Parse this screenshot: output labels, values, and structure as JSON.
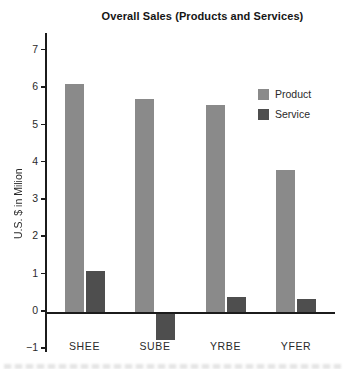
{
  "title": "Overall Sales (Products and Services)",
  "chart_data": {
    "type": "bar",
    "title": "Overall Sales (Products and Services)",
    "categories": [
      "SHEE",
      "SUBE",
      "YRBE",
      "YFER"
    ],
    "series": [
      {
        "name": "Product",
        "color": "#8a8a8a",
        "values": [
          6.1,
          5.7,
          5.55,
          3.8
        ]
      },
      {
        "name": "Service",
        "color": "#4e4e4e",
        "values": [
          1.1,
          -0.7,
          0.4,
          0.35
        ]
      }
    ],
    "xlabel": "",
    "ylabel": "U.S. $ in Milion",
    "ylim": [
      -1,
      7
    ],
    "yticks": [
      -1,
      0,
      1,
      2,
      3,
      4,
      5,
      6,
      7
    ],
    "grid": false,
    "legend_position": "upper right",
    "bar_orientation": "vertical"
  },
  "legend": {
    "items": [
      {
        "label": "Product",
        "color": "#8a8a8a"
      },
      {
        "label": "Service",
        "color": "#4e4e4e"
      }
    ]
  },
  "colors": {
    "background": "#ffffff",
    "axis": "#1b1b1b",
    "text": "#2a2a2a",
    "product_bar": "#8a8a8a",
    "service_bar": "#4e4e4e"
  }
}
